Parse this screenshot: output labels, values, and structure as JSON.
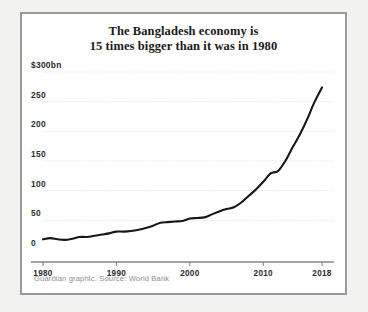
{
  "figure": {
    "background_color": "#ffffff",
    "border_color": "#9a9a9a",
    "page_background": "#f2f2f1"
  },
  "title": {
    "line1": "The Bangladesh economy is",
    "line2": "15 times bigger than it was in 1980"
  },
  "caption": {
    "text": "Guardian graphic. Source: World Bank"
  },
  "chart_data": {
    "type": "line",
    "title": "The Bangladesh economy is 15 times bigger than it was in 1980",
    "subtitle": "",
    "xlabel": "",
    "ylabel": "$300bn",
    "xlim": [
      1980,
      2018
    ],
    "ylim": [
      0,
      300
    ],
    "grid": true,
    "legend": false,
    "line_color": "#17171a",
    "x_tick_labels": [
      "1980",
      "1990",
      "2000",
      "2010",
      "2018"
    ],
    "x_tick_values": [
      1980,
      1990,
      2000,
      2010,
      2018
    ],
    "y_tick_labels": [
      "0",
      "50",
      "100",
      "150",
      "200",
      "250",
      "$300bn"
    ],
    "y_tick_values": [
      0,
      50,
      100,
      150,
      200,
      250,
      300
    ],
    "series": [
      {
        "name": "Bangladesh GDP (current US$ bn)",
        "x": [
          1980,
          1981,
          1982,
          1983,
          1984,
          1985,
          1986,
          1987,
          1988,
          1989,
          1990,
          1991,
          1992,
          1993,
          1994,
          1995,
          1996,
          1997,
          1998,
          1999,
          2000,
          2001,
          2002,
          2003,
          2004,
          2005,
          2006,
          2007,
          2008,
          2009,
          2010,
          2011,
          2012,
          2013,
          2014,
          2015,
          2016,
          2017,
          2018
        ],
        "values": [
          18,
          20,
          18,
          17,
          19,
          22,
          22,
          24,
          26,
          28,
          31,
          31,
          32,
          34,
          37,
          41,
          46,
          47,
          48,
          49,
          53,
          54,
          55,
          60,
          65,
          69,
          72,
          80,
          91,
          102,
          115,
          129,
          133,
          150,
          173,
          195,
          221,
          250,
          274
        ]
      }
    ]
  }
}
